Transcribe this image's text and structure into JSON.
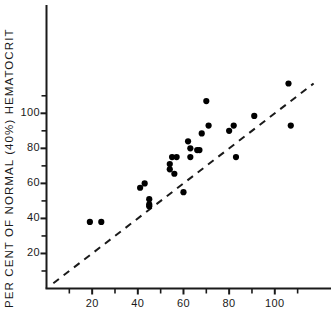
{
  "chart_data": {
    "type": "scatter",
    "title": "",
    "xlabel": "",
    "ylabel": "PER CENT OF NORMAL (40%) HEMATOCRIT",
    "xlim": [
      0,
      118
    ],
    "ylim": [
      0,
      120
    ],
    "xticks_major": [
      20,
      40,
      60,
      80,
      100
    ],
    "xticks_minor": [
      10,
      30,
      50,
      70,
      90,
      110
    ],
    "yticks_major": [
      20,
      40,
      60,
      80,
      100
    ],
    "yticks_minor": [
      10,
      30,
      50,
      70,
      90,
      110
    ],
    "xtick_labels": [
      "20",
      "40",
      "60",
      "80",
      "100"
    ],
    "ytick_labels": [
      "20",
      "40",
      "60",
      "80",
      "100"
    ],
    "grid": false,
    "legend": false,
    "reference_line": {
      "name": "identity-line",
      "style": "dashed",
      "x": [
        3,
        117
      ],
      "y": [
        3,
        117
      ]
    },
    "series": [
      {
        "name": "patients",
        "marker": "filled-circle",
        "color": "#000000",
        "points": [
          {
            "x": 19,
            "y": 38
          },
          {
            "x": 24,
            "y": 38
          },
          {
            "x": 41,
            "y": 57.5
          },
          {
            "x": 43,
            "y": 60
          },
          {
            "x": 45,
            "y": 51
          },
          {
            "x": 45,
            "y": 48
          },
          {
            "x": 45,
            "y": 47
          },
          {
            "x": 54,
            "y": 71
          },
          {
            "x": 54,
            "y": 68
          },
          {
            "x": 55,
            "y": 75
          },
          {
            "x": 56,
            "y": 65.5
          },
          {
            "x": 57,
            "y": 75
          },
          {
            "x": 60,
            "y": 55
          },
          {
            "x": 62,
            "y": 84
          },
          {
            "x": 63,
            "y": 80
          },
          {
            "x": 63,
            "y": 75
          },
          {
            "x": 66,
            "y": 79
          },
          {
            "x": 67,
            "y": 79
          },
          {
            "x": 68,
            "y": 88.5
          },
          {
            "x": 70,
            "y": 107
          },
          {
            "x": 71,
            "y": 93
          },
          {
            "x": 80,
            "y": 90
          },
          {
            "x": 82,
            "y": 93
          },
          {
            "x": 83,
            "y": 75
          },
          {
            "x": 91,
            "y": 98.5
          },
          {
            "x": 106,
            "y": 117
          },
          {
            "x": 107,
            "y": 93
          }
        ]
      }
    ]
  }
}
